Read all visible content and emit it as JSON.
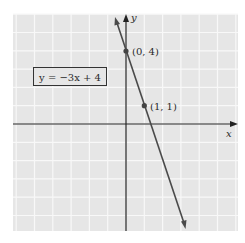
{
  "chart_data": {
    "type": "line",
    "title": "",
    "equation_label": "y = −3x + 4",
    "xlabel": "x",
    "ylabel": "y",
    "grid": true,
    "xlim": [
      -6.2,
      6.1
    ],
    "ylim": [
      -5.9,
      6.0
    ],
    "series": [
      {
        "name": "y = -3x + 4",
        "slope": -3,
        "intercept": 4,
        "x": [
          -0.62,
          3.25
        ],
        "y": [
          5.85,
          -5.74
        ]
      }
    ],
    "points": [
      {
        "x": 0,
        "y": 4,
        "label": "(0, 4)"
      },
      {
        "x": 1,
        "y": 1,
        "label": "(1, 1)"
      }
    ],
    "colors": {
      "background": "#e6e6e6",
      "grid": "#f8f8f8",
      "axes": "#222222",
      "line": "#4a4a4a"
    }
  }
}
